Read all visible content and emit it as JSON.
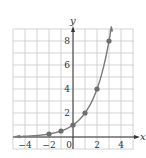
{
  "chart_data": {
    "type": "line",
    "title": "",
    "xlabel": "x",
    "ylabel": "y",
    "function": "y = 2^x",
    "xlim": [
      -5,
      4.5
    ],
    "ylim": [
      -0.4,
      9
    ],
    "grid": true,
    "x_ticks": [
      -4,
      -2,
      0,
      2,
      4
    ],
    "y_ticks": [
      2,
      4,
      6,
      8
    ],
    "x_tick_labels": [
      "−4",
      "−2",
      "0",
      "2",
      "4"
    ],
    "y_tick_labels": [
      "2",
      "4",
      "6",
      "8"
    ],
    "points": [
      {
        "x": -2,
        "y": 0.25
      },
      {
        "x": -1,
        "y": 0.5
      },
      {
        "x": 0,
        "y": 1
      },
      {
        "x": 1,
        "y": 2
      },
      {
        "x": 2,
        "y": 4
      },
      {
        "x": 3,
        "y": 8
      }
    ],
    "curve_color": "#7a7a7a",
    "point_color": "#6e6e6e",
    "grid_color": "#c8c8c8",
    "axis_color": "#333333"
  }
}
